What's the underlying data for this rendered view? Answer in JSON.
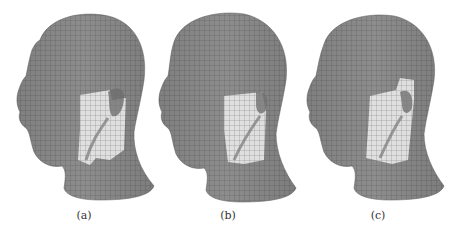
{
  "figure": {
    "panels": [
      {
        "id": "a",
        "label": "(a)",
        "description": "gray mesh head model, side view, with light patch near ear"
      },
      {
        "id": "b",
        "label": "(b)",
        "description": "gray mesh head model, side view, with light patch near ear"
      },
      {
        "id": "c",
        "label": "(c)",
        "description": "gray mesh head model, side view, with light patch near ear"
      }
    ],
    "colors": {
      "mesh_fill": "#8a8a8a",
      "mesh_lines": "#5e5e5e",
      "highlight": "#e6e6e6",
      "background": "#ffffff"
    }
  }
}
